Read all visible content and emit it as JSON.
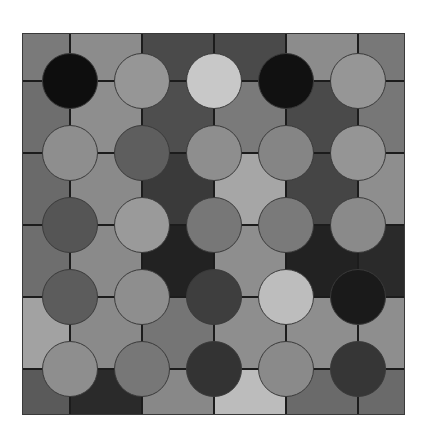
{
  "board": {
    "rows": 5,
    "cols": 5,
    "tile_colors": [
      [
        "#7a7a7a",
        "#8c8c8c",
        "#4a4a4a",
        "#4a4a4a",
        "#8c8c8c",
        "#787878"
      ],
      [
        "#6e6e6e",
        "#8e8e8e",
        "#4e4e4e",
        "#7a7a7a",
        "#4a4a4a",
        "#777777"
      ],
      [
        "#6a6a6a",
        "#8a8a8a",
        "#3a3a3a",
        "#a6a6a6",
        "#454545",
        "#8e8e8e"
      ],
      [
        "#6e6e6e",
        "#8a8a8a",
        "#222222",
        "#8e8e8e",
        "#222222",
        "#2a2a2a"
      ],
      [
        "#a2a2a2",
        "#8a8a8a",
        "#757575",
        "#8e8e8e",
        "#8e8e8e",
        "#8e8e8e"
      ],
      [
        "#5a5a5a",
        "#2a2a2a",
        "#888888",
        "#bcbcbc",
        "#6a6a6a",
        "#6a6a6a"
      ]
    ],
    "circle_colors": [
      [
        "#0e0e0e",
        "#969696",
        "#c8c8c8",
        "#111111",
        "#969696"
      ],
      [
        "#8e8e8e",
        "#5e5e5e",
        "#8e8e8e",
        "#858585",
        "#959595"
      ],
      [
        "#555555",
        "#9a9a9a",
        "#777777",
        "#7a7a7a",
        "#8a8a8a"
      ],
      [
        "#5c5c5c",
        "#8e8e8e",
        "#3e3e3e",
        "#bdbdbd",
        "#1a1a1a"
      ],
      [
        "#8e8e8e",
        "#777777",
        "#333333",
        "#8a8a8a",
        "#363636"
      ]
    ]
  }
}
